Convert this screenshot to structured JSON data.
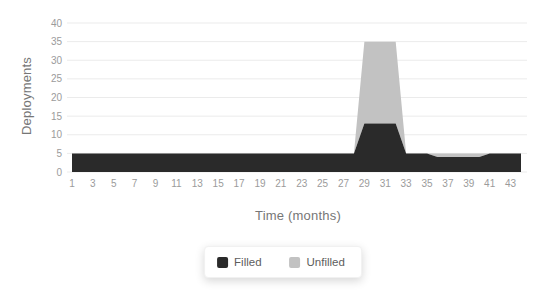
{
  "axes": {
    "x_title": "Time (months)",
    "y_title": "Deployments"
  },
  "legend": {
    "items": [
      {
        "label": "Filled",
        "color": "#2a2a2a"
      },
      {
        "label": "Unfilled",
        "color": "#c2c2c2"
      }
    ]
  },
  "colors": {
    "gridline": "#ebebeb",
    "tick_text": "#9b9b9b",
    "axis_title_text": "#767676",
    "background": "#ffffff"
  },
  "chart_data": {
    "type": "area",
    "stacked": true,
    "title": "",
    "xlabel": "Time (months)",
    "ylabel": "Deployments",
    "grid": "horizontal",
    "legend_position": "bottom",
    "xlim": [
      1,
      44
    ],
    "ylim": [
      0,
      40
    ],
    "x_ticks": [
      1,
      3,
      5,
      7,
      9,
      11,
      13,
      15,
      17,
      19,
      21,
      23,
      25,
      27,
      29,
      31,
      33,
      35,
      37,
      39,
      41,
      43
    ],
    "y_ticks": [
      0,
      5,
      10,
      15,
      20,
      25,
      30,
      35,
      40
    ],
    "x": [
      1,
      2,
      3,
      4,
      5,
      6,
      7,
      8,
      9,
      10,
      11,
      12,
      13,
      14,
      15,
      16,
      17,
      18,
      19,
      20,
      21,
      22,
      23,
      24,
      25,
      26,
      27,
      28,
      29,
      30,
      31,
      32,
      33,
      34,
      35,
      36,
      37,
      38,
      39,
      40,
      41,
      42,
      43,
      44
    ],
    "series": [
      {
        "name": "Filled",
        "color": "#2a2a2a",
        "values": [
          5,
          5,
          5,
          5,
          5,
          5,
          5,
          5,
          5,
          5,
          5,
          5,
          5,
          5,
          5,
          5,
          5,
          5,
          5,
          5,
          5,
          5,
          5,
          5,
          5,
          5,
          5,
          5,
          13,
          13,
          13,
          13,
          5,
          5,
          5,
          4,
          4,
          4,
          4,
          4,
          5,
          5,
          5,
          5
        ]
      },
      {
        "name": "Unfilled",
        "color": "#c2c2c2",
        "values": [
          0,
          0,
          0,
          0,
          0,
          0,
          0,
          0,
          0,
          0,
          0,
          0,
          0,
          0,
          0,
          0,
          0,
          0,
          0,
          0,
          0,
          0,
          0,
          0,
          0,
          0,
          0,
          0,
          22,
          22,
          22,
          22,
          0,
          0,
          0,
          1,
          1,
          1,
          1,
          1,
          0,
          0,
          0,
          0
        ]
      }
    ]
  }
}
